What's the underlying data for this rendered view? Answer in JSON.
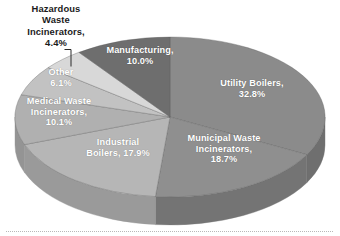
{
  "chart_data": {
    "type": "pie",
    "title": "",
    "subtitle": "",
    "xlabel": "",
    "ylabel": "",
    "style": "3d-exploded-none",
    "legend_position": "none",
    "labels_inside_slices": true,
    "grid": false,
    "units": "percent",
    "categories": [
      "Utility Boilers",
      "Municipal Waste Incinerators",
      "Industrial Boilers",
      "Medical Waste Incinerators",
      "Other",
      "Hazardous Waste Incinerators",
      "Manufacturing"
    ],
    "values": [
      32.8,
      18.7,
      17.9,
      10.1,
      6.1,
      4.4,
      10.0
    ],
    "slices": [
      {
        "name": "Utility Boilers",
        "label": "Utility Boilers,\n32.8%",
        "value": 32.8,
        "value_text": "32.8%",
        "color": "#8b8b8b",
        "side_color": "#6f6f6f",
        "label_color": "#ffffff",
        "label_placement": "inside"
      },
      {
        "name": "Municipal Waste Incinerators",
        "label": "Municipal Waste\nIncinerators,\n18.7%",
        "value": 18.7,
        "value_text": "18.7%",
        "color": "#8f8f8f",
        "side_color": "#747474",
        "label_color": "#ffffff",
        "label_placement": "inside"
      },
      {
        "name": "Industrial Boilers",
        "label": "Industrial\nBoilers,  17.9%",
        "value": 17.9,
        "value_text": "17.9%",
        "color": "#b6b6b6",
        "side_color": "#9a9a9a",
        "label_color": "#ffffff",
        "label_placement": "inside"
      },
      {
        "name": "Medical Waste Incinerators",
        "label": "Medical Waste\nIncinerators,\n10.1%",
        "value": 10.1,
        "value_text": "10.1%",
        "color": "#b0b0b0",
        "side_color": "#949494",
        "label_color": "#ffffff",
        "label_placement": "inside"
      },
      {
        "name": "Other",
        "label": "Other\n6.1%",
        "value": 6.1,
        "value_text": "6.1%",
        "color": "#c2c2c2",
        "side_color": "#a6a6a6",
        "label_color": "#ffffff",
        "label_placement": "inside"
      },
      {
        "name": "Hazardous Waste Incinerators",
        "label": "Hazardous\nWaste\nIncinerators,\n4.4%",
        "value": 4.4,
        "value_text": "4.4%",
        "color": "#d8d8d8",
        "side_color": "#bcbcbc",
        "label_color": "#1b1b1b",
        "label_placement": "outside-leader"
      },
      {
        "name": "Manufacturing",
        "label": "Manufacturing,\n10.0%",
        "value": 10.0,
        "value_text": "10.0%",
        "color": "#6e6e6e",
        "side_color": "#5a5a5a",
        "label_color": "#ffffff",
        "label_placement": "inside"
      }
    ]
  },
  "labels": {
    "hazardous": "Hazardous\nWaste\nIncinerators,\n4.4%",
    "manufacturing": "Manufacturing,\n10.0%",
    "utility": "Utility Boilers,\n32.8%",
    "municipal": "Municipal Waste\nIncinerators,\n18.7%",
    "industrial": "Industrial\nBoilers,  17.9%",
    "medical": "Medical Waste\nIncinerators,\n10.1%",
    "other": "Other\n6.1%"
  }
}
